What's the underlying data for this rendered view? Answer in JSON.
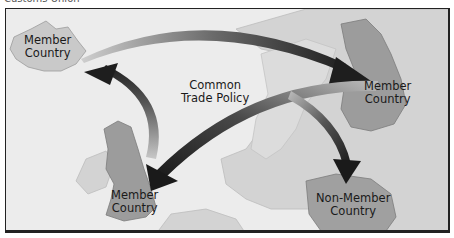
{
  "caption": "Customs Union",
  "diagram": {
    "title": "Customs Union",
    "center_label": [
      "Common",
      "Trade Policy"
    ],
    "nodes": [
      {
        "id": "iceland",
        "label": [
          "Member",
          "Country"
        ],
        "type": "member"
      },
      {
        "id": "finland",
        "label": [
          "Member",
          "Country"
        ],
        "type": "member"
      },
      {
        "id": "uk",
        "label": [
          "Member",
          "Country"
        ],
        "type": "member"
      },
      {
        "id": "poland",
        "label": [
          "Non-Member",
          "Country"
        ],
        "type": "non-member"
      }
    ],
    "edges": [
      {
        "from": "iceland",
        "to": "finland"
      },
      {
        "from": "uk",
        "to": "iceland"
      },
      {
        "from": "finland",
        "to": "uk"
      },
      {
        "from": "finland",
        "to": "poland"
      }
    ],
    "colors": {
      "sea": "#ececec",
      "land_other": "#d2d2d2",
      "member_land": "#9a9a9a",
      "iceland_land": "#c9c9c9",
      "arrow": "#2a2a2a",
      "frame": "#222222"
    }
  }
}
